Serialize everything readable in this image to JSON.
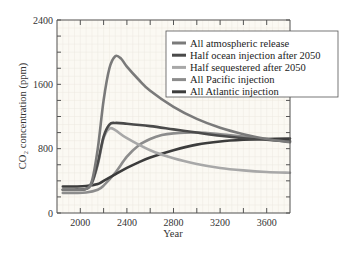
{
  "chart_data": {
    "type": "line",
    "title": "",
    "xlabel": "Year",
    "ylabel": "CO₂ concentration (ppm)",
    "xlim": [
      1800,
      3800
    ],
    "ylim": [
      0,
      2400
    ],
    "xticks": [
      2000,
      2400,
      2800,
      3200,
      3600
    ],
    "xtick_labels": [
      "2000",
      "2400",
      "2800",
      "3200",
      "3600"
    ],
    "xminor_ticks": [
      2200,
      2600,
      3000,
      3400
    ],
    "yticks": [
      0,
      800,
      1600,
      2400
    ],
    "ytick_labels": [
      "0",
      "800",
      "1600",
      "2400"
    ],
    "yminor_ticks": [
      200,
      400,
      600,
      1000,
      1200,
      1400,
      1800,
      2000,
      2200
    ],
    "grid": true,
    "legend_position": "top-right",
    "series": [
      {
        "name": "All atmospheric release",
        "color": "#7a7a7a",
        "x": [
          1850,
          1950,
          2050,
          2100,
          2150,
          2200,
          2250,
          2300,
          2350,
          2400,
          2500,
          2600,
          2800,
          3000,
          3200,
          3400,
          3600,
          3800
        ],
        "y": [
          290,
          290,
          300,
          400,
          800,
          1400,
          1800,
          1950,
          1920,
          1820,
          1660,
          1520,
          1320,
          1170,
          1060,
          980,
          920,
          880
        ]
      },
      {
        "name": "Half ocean injection after 2050",
        "color": "#4a4a4a",
        "x": [
          1850,
          1950,
          2050,
          2100,
          2150,
          2200,
          2250,
          2300,
          2400,
          2600,
          2800,
          3000,
          3200,
          3400,
          3600,
          3800
        ],
        "y": [
          290,
          290,
          300,
          380,
          620,
          950,
          1100,
          1120,
          1110,
          1080,
          1040,
          1000,
          960,
          930,
          910,
          890
        ]
      },
      {
        "name": "Half sequestered after 2050",
        "color": "#a8a8a8",
        "x": [
          1850,
          1950,
          2050,
          2100,
          2150,
          2200,
          2250,
          2300,
          2400,
          2600,
          2800,
          3000,
          3200,
          3400,
          3600,
          3800
        ],
        "y": [
          290,
          290,
          300,
          370,
          600,
          930,
          1050,
          1030,
          930,
          780,
          680,
          610,
          560,
          530,
          510,
          500
        ]
      },
      {
        "name": "All Pacific injection",
        "color": "#8c8c8c",
        "x": [
          1850,
          1950,
          2050,
          2150,
          2200,
          2300,
          2400,
          2500,
          2600,
          2700,
          2800,
          3000,
          3200,
          3400,
          3600,
          3800
        ],
        "y": [
          250,
          250,
          255,
          290,
          340,
          500,
          700,
          840,
          920,
          970,
          990,
          1000,
          980,
          950,
          920,
          900
        ]
      },
      {
        "name": "All Atlantic injection",
        "color": "#3c3c3c",
        "x": [
          1850,
          1950,
          2050,
          2150,
          2200,
          2300,
          2400,
          2500,
          2600,
          2800,
          3000,
          3200,
          3400,
          3600,
          3800
        ],
        "y": [
          330,
          330,
          335,
          360,
          400,
          480,
          560,
          630,
          690,
          780,
          850,
          890,
          910,
          920,
          925
        ]
      }
    ]
  }
}
